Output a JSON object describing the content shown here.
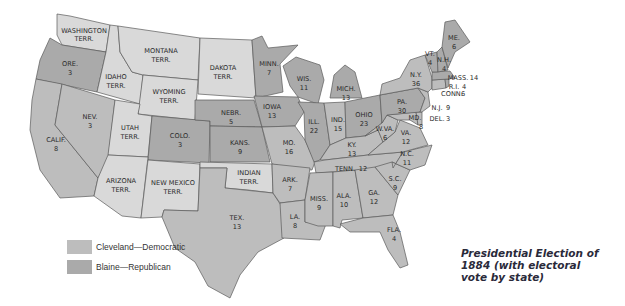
{
  "title": "Presidential Election of 1884 (with electoral vote by state)",
  "title_lines": [
    "Presidential Election of",
    "1884 (with electoral",
    "vote by state)"
  ],
  "colors": {
    "democratic": "#bdbdbd",
    "republican": "#aaaaaa",
    "territory": "#d9d9d9",
    "border": "#5a5a5a"
  },
  "legend": [
    {
      "label": "Cleveland—Democratic",
      "color": "#bdbdbd"
    },
    {
      "label": "Blaine—Republican",
      "color": "#aaaaaa"
    }
  ],
  "regions": {
    "wash": {
      "name": "WASHINGTON",
      "sub": "TERR."
    },
    "ore": {
      "name": "ORE.",
      "votes": "3"
    },
    "calif": {
      "name": "CALIF.",
      "votes": "8"
    },
    "nev": {
      "name": "NEV.",
      "votes": "3"
    },
    "idaho": {
      "name": "IDAHO",
      "sub": "TERR."
    },
    "mont": {
      "name": "MONTANA",
      "sub": "TERR."
    },
    "wyo": {
      "name": "WYOMING",
      "sub": "TERR."
    },
    "utah": {
      "name": "UTAH",
      "sub": "TERR."
    },
    "colo": {
      "name": "COLO.",
      "votes": "3"
    },
    "ariz": {
      "name": "ARIZONA",
      "sub": "TERR."
    },
    "nm": {
      "name": "NEW MEXICO",
      "sub": "TERR."
    },
    "dak": {
      "name": "DAKOTA",
      "sub": "TERR."
    },
    "nebr": {
      "name": "NEBR.",
      "votes": "5"
    },
    "kans": {
      "name": "KANS.",
      "votes": "9"
    },
    "ind_terr": {
      "name": "INDIAN",
      "sub": "TERR."
    },
    "tex": {
      "name": "TEX.",
      "votes": "13"
    },
    "minn": {
      "name": "MINN.",
      "votes": "7"
    },
    "iowa": {
      "name": "IOWA",
      "votes": "13"
    },
    "mo": {
      "name": "MO.",
      "votes": "16"
    },
    "ark": {
      "name": "ARK.",
      "votes": "7"
    },
    "la": {
      "name": "LA.",
      "votes": "8"
    },
    "wis": {
      "name": "WIS.",
      "votes": "11"
    },
    "ill": {
      "name": "ILL.",
      "votes": "22"
    },
    "mich": {
      "name": "MICH.",
      "votes": "13"
    },
    "ind": {
      "name": "IND.",
      "votes": "15"
    },
    "ohio": {
      "name": "OHIO",
      "votes": "23"
    },
    "ky": {
      "name": "KY.",
      "votes": "13"
    },
    "tenn": {
      "name": "TENN.",
      "votes": "12"
    },
    "miss": {
      "name": "MISS.",
      "votes": "9"
    },
    "ala": {
      "name": "ALA.",
      "votes": "10"
    },
    "ga": {
      "name": "GA.",
      "votes": "12"
    },
    "fla": {
      "name": "FLA.",
      "votes": "4"
    },
    "sc": {
      "name": "S.C.",
      "votes": "9"
    },
    "nc": {
      "name": "N.C.",
      "votes": "11"
    },
    "va": {
      "name": "VA.",
      "votes": "12"
    },
    "wva": {
      "name": "W.VA.",
      "votes": "6"
    },
    "md": {
      "name": "MD.",
      "votes": "8"
    },
    "del": {
      "name": "DEL.",
      "votes": "3"
    },
    "pa": {
      "name": "PA.",
      "votes": "30"
    },
    "nj": {
      "name": "N.J.",
      "votes": "9"
    },
    "ny": {
      "name": "N.Y.",
      "votes": "36"
    },
    "conn": {
      "name": "CONN.",
      "votes": "6"
    },
    "ri": {
      "name": "R.I.",
      "votes": "4"
    },
    "mass": {
      "name": "MASS.",
      "votes": "14"
    },
    "vt": {
      "name": "VT.",
      "votes": "4"
    },
    "nh": {
      "name": "N.H.",
      "votes": "4"
    },
    "me": {
      "name": "ME.",
      "votes": "6"
    }
  }
}
